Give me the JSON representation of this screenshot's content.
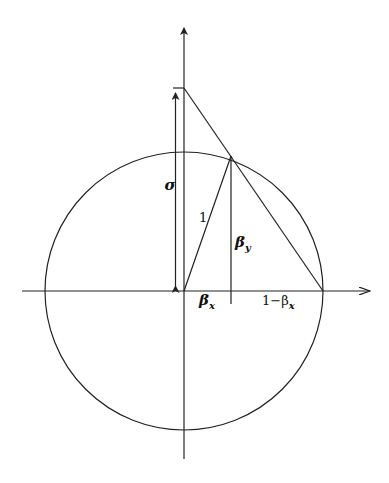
{
  "diagram": {
    "type": "geometric-construction",
    "labels": {
      "sigma": "σ",
      "one": "1",
      "beta_y": "β",
      "beta_y_sub": "y",
      "beta_x": "β",
      "beta_x_sub": "x",
      "one_minus_beta_x_prefix": "1−β",
      "one_minus_beta_x_sub": "x"
    },
    "geometry": {
      "origin": [
        184,
        291
      ],
      "radius": 139,
      "point_on_circle": [
        231,
        156
      ],
      "sigma_top": [
        184,
        88
      ],
      "right_intersection": [
        323,
        291
      ]
    },
    "colors": {
      "stroke": "#222222",
      "background": "#ffffff"
    }
  }
}
